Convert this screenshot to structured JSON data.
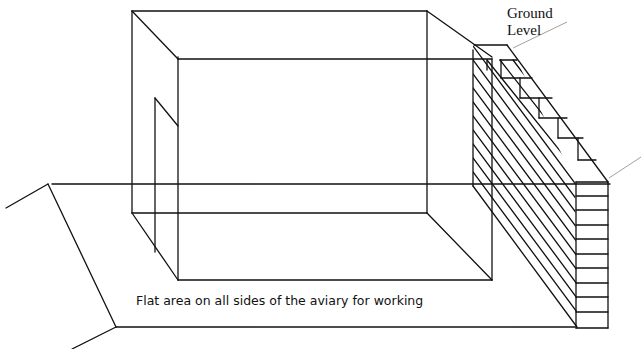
{
  "diagram": {
    "labels": {
      "ground_level_line1": "Ground",
      "ground_level_line2": "Level",
      "flat_area": "Flat area on all sides of the aviary for working"
    },
    "components": [
      "aviary-box",
      "aviary-door",
      "flat-working-pad",
      "slope-banks",
      "stepped-retaining-wall",
      "hatched-soil-section",
      "ground-level-leader-lines"
    ],
    "colors": {
      "line": "#111111",
      "leader": "#888888",
      "background": "#ffffff"
    }
  }
}
